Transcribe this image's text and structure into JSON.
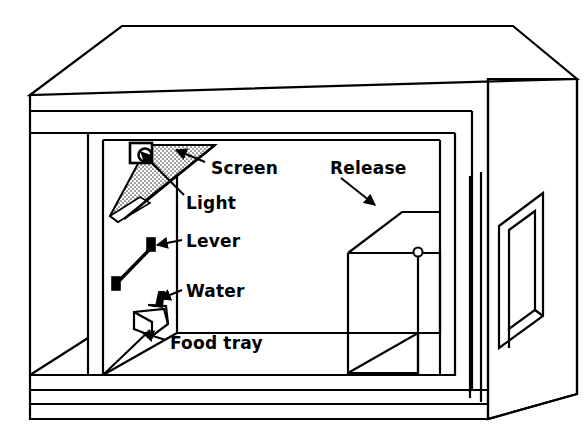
{
  "figure": {
    "name": "operant-conditioning-chamber",
    "background_color": "#ffffff",
    "ink_color": "#000000",
    "screen_fill_color": "#b5b5b5",
    "width": 585,
    "height": 441
  },
  "labels": [
    {
      "id": "screen",
      "text": "Screen",
      "x": 211,
      "y": 168
    },
    {
      "id": "light",
      "text": "Light",
      "x": 186,
      "y": 203
    },
    {
      "id": "lever",
      "text": "Lever",
      "x": 186,
      "y": 245
    },
    {
      "id": "water",
      "text": "Water",
      "x": 186,
      "y": 295
    },
    {
      "id": "food_tray",
      "text": "Food tray",
      "x": 170,
      "y": 345
    },
    {
      "id": "release",
      "text": "Release",
      "x": 330,
      "y": 168
    }
  ],
  "parts": {
    "screen": "projection screen mounted at an angle below the ceiling",
    "light": "lamp in bracket at upper left of chamber wall",
    "lever": "response lever protruding from the chamber wall",
    "water": "water spout below the lever",
    "food_tray": "food delivery tray at floor level",
    "release": "release chute / door assembly on the right of the chamber"
  },
  "leaders": [
    {
      "id": "screen-leader",
      "from_x": 201,
      "from_y": 163,
      "to_x": 176,
      "to_y": 152
    },
    {
      "id": "light-leader",
      "from_x": 180,
      "from_y": 196,
      "to_x": 140,
      "to_y": 149
    },
    {
      "id": "lever-leader",
      "from_x": 180,
      "from_y": 241,
      "to_x": 152,
      "to_y": 244
    },
    {
      "id": "water-leader",
      "from_x": 180,
      "from_y": 291,
      "to_x": 155,
      "to_y": 298
    },
    {
      "id": "food-tray-leader",
      "from_x": 163,
      "from_y": 340,
      "to_x": 140,
      "to_y": 334
    },
    {
      "id": "release-leader",
      "from_x": 340,
      "from_y": 176,
      "to_x": 375,
      "to_y": 203
    }
  ]
}
